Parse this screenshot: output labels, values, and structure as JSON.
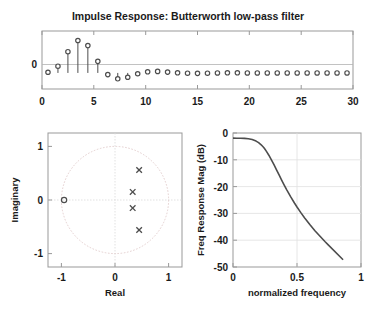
{
  "figure": {
    "background": "#ffffff",
    "axis_color": "#999999",
    "marker_color": "#4d4d4d",
    "curve_color": "#4d4d4d",
    "grid_color": "#d9d9d9"
  },
  "chart_data": [
    {
      "id": "impulse-response",
      "type": "line",
      "plot_style": "stem",
      "title": "Impulse Response: Butterworth low-pass filter",
      "xlabel": "",
      "ylabel": "",
      "xlim": [
        -0.6,
        30.6
      ],
      "ylim": [
        -0.115,
        0.3
      ],
      "xticks": [
        0,
        5,
        10,
        15,
        20,
        25,
        30
      ],
      "xticklabels": [
        "0",
        "5",
        "10",
        "15",
        "20",
        "25",
        "30"
      ],
      "yticks": [
        0
      ],
      "yticklabels": [
        "0"
      ],
      "grid": false,
      "marker": "circle-open",
      "x": [
        0,
        1,
        2,
        3,
        4,
        5,
        6,
        7,
        8,
        9,
        10,
        11,
        12,
        13,
        14,
        15,
        16,
        17,
        18,
        19,
        20,
        21,
        22,
        23,
        24,
        25,
        26,
        27,
        28,
        29,
        30
      ],
      "values": [
        0.005,
        0.048,
        0.152,
        0.232,
        0.196,
        0.083,
        -0.012,
        -0.042,
        -0.031,
        -0.006,
        0.008,
        0.011,
        0.006,
        0.001,
        -0.002,
        -0.003,
        -0.002,
        0.0,
        0.001,
        0.001,
        0.0,
        0.0,
        0.0,
        0.0,
        0.0,
        0.0,
        0.0,
        0.0,
        0.0,
        0.0,
        0.0
      ]
    },
    {
      "id": "pole-zero",
      "type": "scatter",
      "title": "",
      "xlabel": "Real",
      "ylabel": "Imaginary",
      "xlim": [
        -1.25,
        1.25
      ],
      "ylim": [
        -1.25,
        1.25
      ],
      "xticks": [
        -1,
        0,
        1
      ],
      "xticklabels": [
        "-1",
        "0",
        "1"
      ],
      "yticks": [
        -1,
        0,
        1
      ],
      "yticklabels": [
        "-1",
        "0",
        "1"
      ],
      "grid": true,
      "unit_circle": true,
      "series": [
        {
          "name": "poles",
          "marker": "x",
          "points": [
            {
              "re": 0.45,
              "im": 0.56
            },
            {
              "re": 0.33,
              "im": 0.15
            },
            {
              "re": 0.33,
              "im": -0.15
            },
            {
              "re": 0.45,
              "im": -0.56
            }
          ]
        },
        {
          "name": "zeros",
          "marker": "circle-open",
          "points": [
            {
              "re": -0.95,
              "im": 0.0
            }
          ]
        }
      ]
    },
    {
      "id": "freq-response",
      "type": "line",
      "title": "",
      "xlabel": "normalized frequency",
      "ylabel": "Freq Response Mag (dB)",
      "xlim": [
        0,
        1
      ],
      "ylim": [
        -50,
        2
      ],
      "xticks": [
        0,
        0.5,
        1
      ],
      "xticklabels": [
        "0",
        "0.5",
        "1"
      ],
      "yticks": [
        0,
        -10,
        -20,
        -30,
        -40,
        -50
      ],
      "yticklabels": [
        "0",
        "-10",
        "-20",
        "-30",
        "-40",
        "-50"
      ],
      "grid": true,
      "cutoff": 0.25,
      "order": 4,
      "x": [
        0.0,
        0.03,
        0.06,
        0.09,
        0.12,
        0.15,
        0.18,
        0.2,
        0.22,
        0.24,
        0.25,
        0.26,
        0.28,
        0.3,
        0.32,
        0.34,
        0.36,
        0.38,
        0.4,
        0.42,
        0.45,
        0.48,
        0.5,
        0.53,
        0.56,
        0.6,
        0.64,
        0.68,
        0.72,
        0.74
      ],
      "values": [
        0.0,
        -0.01,
        -0.03,
        -0.09,
        -0.24,
        -0.55,
        -1.14,
        -1.75,
        -2.58,
        -3.65,
        -4.3,
        -5.02,
        -6.62,
        -8.4,
        -10.3,
        -12.28,
        -14.27,
        -16.25,
        -18.19,
        -20.06,
        -22.7,
        -25.16,
        -26.7,
        -28.9,
        -30.95,
        -33.5,
        -35.9,
        -38.1,
        -40.2,
        -41.2
      ]
    }
  ]
}
